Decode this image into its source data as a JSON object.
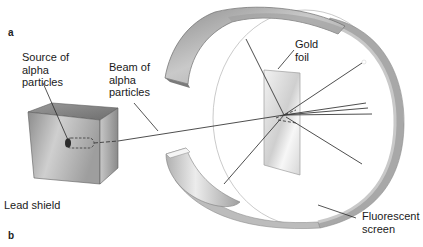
{
  "figure": {
    "panels": [
      "a",
      "b"
    ]
  },
  "labels": {
    "source": "Source of\nalpha\nparticles",
    "beam": "Beam of\nalpha\nparticles",
    "gold_foil": "Gold\nfoil",
    "lead_shield": "Lead shield",
    "fluorescent_screen": "Fluorescent\nscreen"
  },
  "colors": {
    "background": "#ffffff",
    "metal_light": "#e6e6e6",
    "metal_mid": "#b5b5b5",
    "metal_dark": "#7d7d7d",
    "line": "#3a3a3a",
    "screen_edge": "#9a9a9a"
  }
}
